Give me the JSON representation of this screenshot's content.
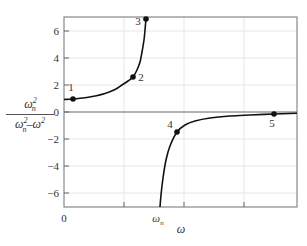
{
  "chart_data": {
    "type": "line",
    "title": "",
    "xlabel": "ω",
    "ylabel": "ωn² / (ωn² − ω²)",
    "ylabel_parts": {
      "numerator": "ω",
      "numerator_sub": "n",
      "numerator_sup": "2",
      "denominator_a": "ω",
      "denominator_a_sub": "n",
      "denominator_a_sup": "2",
      "denominator_b": "–ω",
      "denominator_b_sup": "2"
    },
    "ylim": [
      -7,
      7
    ],
    "yticks": [
      -6,
      -4,
      -2,
      0,
      2,
      4,
      6
    ],
    "xtick_labels": [
      {
        "label": "0",
        "x_ratio": 0
      },
      {
        "label": "ωn",
        "x_ratio": 1
      }
    ],
    "x_minor_ticks_ratio": [
      0.625,
      1.25,
      1.875
    ],
    "grid": true,
    "asymptote": {
      "x_ratio": 1,
      "label": "ωn"
    },
    "series": [
      {
        "name": "branch below ωn",
        "points_px": [
          [
            64,
            99.5
          ],
          [
            73,
            99
          ],
          [
            85,
            97.8
          ],
          [
            95,
            96
          ],
          [
            105,
            93.5
          ],
          [
            115,
            89.5
          ],
          [
            122,
            85
          ],
          [
            128,
            81
          ],
          [
            133,
            77
          ],
          [
            137,
            70
          ],
          [
            140,
            62
          ],
          [
            142,
            52
          ],
          [
            144,
            40
          ],
          [
            145,
            30
          ],
          [
            146,
            19
          ]
        ]
      },
      {
        "name": "branch above ωn",
        "points_px": [
          [
            160,
            207
          ],
          [
            161,
            195
          ],
          [
            163,
            178
          ],
          [
            166,
            160
          ],
          [
            170,
            146
          ],
          [
            177,
            132
          ],
          [
            185,
            125
          ],
          [
            195,
            121
          ],
          [
            210,
            118
          ],
          [
            230,
            116
          ],
          [
            250,
            115
          ],
          [
            274,
            114
          ],
          [
            297,
            113.3
          ]
        ]
      }
    ],
    "marked_points": [
      {
        "label": "1",
        "px": [
          73,
          99
        ],
        "y_value": 0.96,
        "label_offset": [
          -2,
          -8
        ]
      },
      {
        "label": "2",
        "px": [
          133,
          77
        ],
        "y_value": 2.6,
        "label_offset": [
          8,
          4
        ]
      },
      {
        "label": "3",
        "px": [
          146,
          19
        ],
        "y_value": 6.9,
        "label_offset": [
          -8,
          6
        ]
      },
      {
        "label": "4",
        "px": [
          177,
          132
        ],
        "y_value": -1.5,
        "label_offset": [
          -7,
          -4
        ]
      },
      {
        "label": "5",
        "px": [
          274,
          114
        ],
        "y_value": -0.15,
        "label_offset": [
          -2,
          13
        ]
      }
    ]
  },
  "layout": {
    "plot": {
      "left": 64,
      "top": 17,
      "right": 297,
      "bottom": 207
    },
    "y_zero_px": 112,
    "px_per_unit_y": 13.5,
    "x_zero_px": 64,
    "x_omega_n_px": 160
  },
  "colors": {
    "curve": "#111111",
    "frame": "#888888",
    "grid": "#e6e6e6",
    "text": "#333333"
  }
}
